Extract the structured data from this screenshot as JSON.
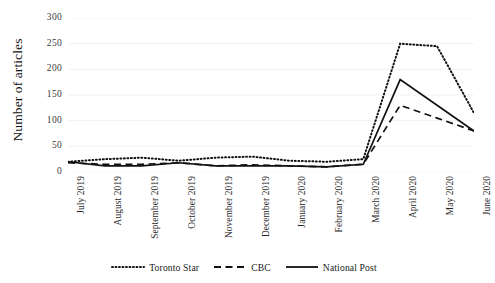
{
  "chart_data": {
    "type": "line",
    "title": "",
    "xlabel": "",
    "ylabel": "Number of articles",
    "ylim": [
      0,
      300
    ],
    "yticks": [
      0,
      50,
      100,
      150,
      200,
      250,
      300
    ],
    "grid": true,
    "legend_position": "bottom-center",
    "categories": [
      "July 2019",
      "August 2019",
      "September 2019",
      "October 2019",
      "November 2019",
      "December 2019",
      "January 2020",
      "February 2020",
      "March 2020",
      "April 2020",
      "May 2020",
      "June 2020"
    ],
    "series": [
      {
        "name": "Toronto Star",
        "style": "dotted",
        "color": "#111111",
        "values": [
          20,
          25,
          28,
          22,
          28,
          30,
          22,
          20,
          25,
          250,
          245,
          115
        ]
      },
      {
        "name": "CBC",
        "style": "dashed",
        "color": "#111111",
        "values": [
          18,
          15,
          15,
          18,
          12,
          14,
          12,
          10,
          15,
          130,
          105,
          80
        ]
      },
      {
        "name": "National Post",
        "style": "solid",
        "color": "#111111",
        "values": [
          20,
          12,
          12,
          18,
          12,
          12,
          12,
          10,
          15,
          180,
          130,
          80
        ]
      }
    ]
  },
  "axis": {
    "y_title": "Number of articles",
    "y_tick_labels": [
      "300",
      "250",
      "200",
      "150",
      "100",
      "50",
      "0"
    ]
  },
  "legend": {
    "items": [
      {
        "label": "Toronto Star",
        "style": "dotted"
      },
      {
        "label": "CBC",
        "style": "dashed"
      },
      {
        "label": "National Post",
        "style": "solid"
      }
    ]
  },
  "style": {
    "grid_color": "#f2f2f2",
    "line_color": "#111111",
    "background": "#ffffff"
  }
}
